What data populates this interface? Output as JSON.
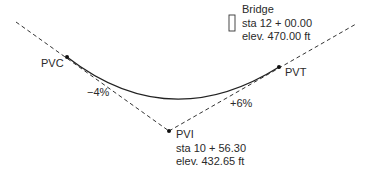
{
  "diagram": {
    "type": "vertical-curve",
    "points": {
      "pvc": {
        "label": "PVC"
      },
      "pvt": {
        "label": "PVT"
      },
      "pvi": {
        "label": "PVI",
        "station": "sta 10 + 56.30",
        "elevation": "elev. 432.65 ft"
      }
    },
    "grades": {
      "back": "−4%",
      "forward": "+6%"
    },
    "bridge": {
      "label": "Bridge",
      "station": "sta 12 + 00.00",
      "elevation": "elev. 470.00 ft"
    },
    "colors": {
      "line": "#222222",
      "dash": "#333333"
    }
  }
}
